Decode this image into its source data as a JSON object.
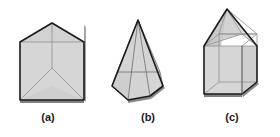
{
  "figure": {
    "type": "geometric-solids-diagram",
    "background_color": "#ffffff",
    "solids": [
      {
        "label": "(a)",
        "name": "triangular-prism",
        "description": "Triangular prism standing upright, viewed from slightly below, showing rectangular lateral faces and the triangular base",
        "fill_color": "#d4d4d4",
        "outline_color": "#1a1a1a",
        "inner_line_color": "#8c8c8c"
      },
      {
        "label": "(b)",
        "name": "hexagonal-pyramid",
        "description": "Tall hexagonal pyramid with apex at top and hexagonal base, internal edges visible",
        "fill_color": "#d4d4d4",
        "outline_color": "#1a1a1a",
        "inner_line_color": "#6e6e6e"
      },
      {
        "label": "(c)",
        "name": "cube-with-pyramid",
        "description": "Cube topped by a square pyramid, drawn transparently so hidden edges show",
        "fill_color": "#d4d4d4",
        "outline_color": "#1a1a1a",
        "inner_line_color": "#8c8c8c"
      }
    ]
  },
  "captions": {
    "a": "(a)",
    "b": "(b)",
    "c": "(c)"
  },
  "colors": {
    "face_fill": "#d4d4d4",
    "face_fill_light": "#dcdcdc",
    "face_fill_dark": "#c4c4c4",
    "outline": "#1a1a1a",
    "hidden_edge": "#8c8c8c",
    "shadow": "#6b6b6b",
    "caption_text": "#1a1a1a"
  }
}
